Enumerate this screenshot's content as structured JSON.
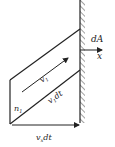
{
  "diagram": {
    "labels": {
      "area": "dA",
      "axis": "x",
      "velocity": "v",
      "velocity_sub": "1",
      "slant": "v",
      "slant_sub": "1",
      "slant_tail": "dt",
      "normal": "n",
      "normal_sub": "1",
      "bottom": "v",
      "bottom_sub": "x",
      "bottom_tail": "dt"
    },
    "colors": {
      "stroke": "#222222",
      "background": "#ffffff"
    }
  }
}
